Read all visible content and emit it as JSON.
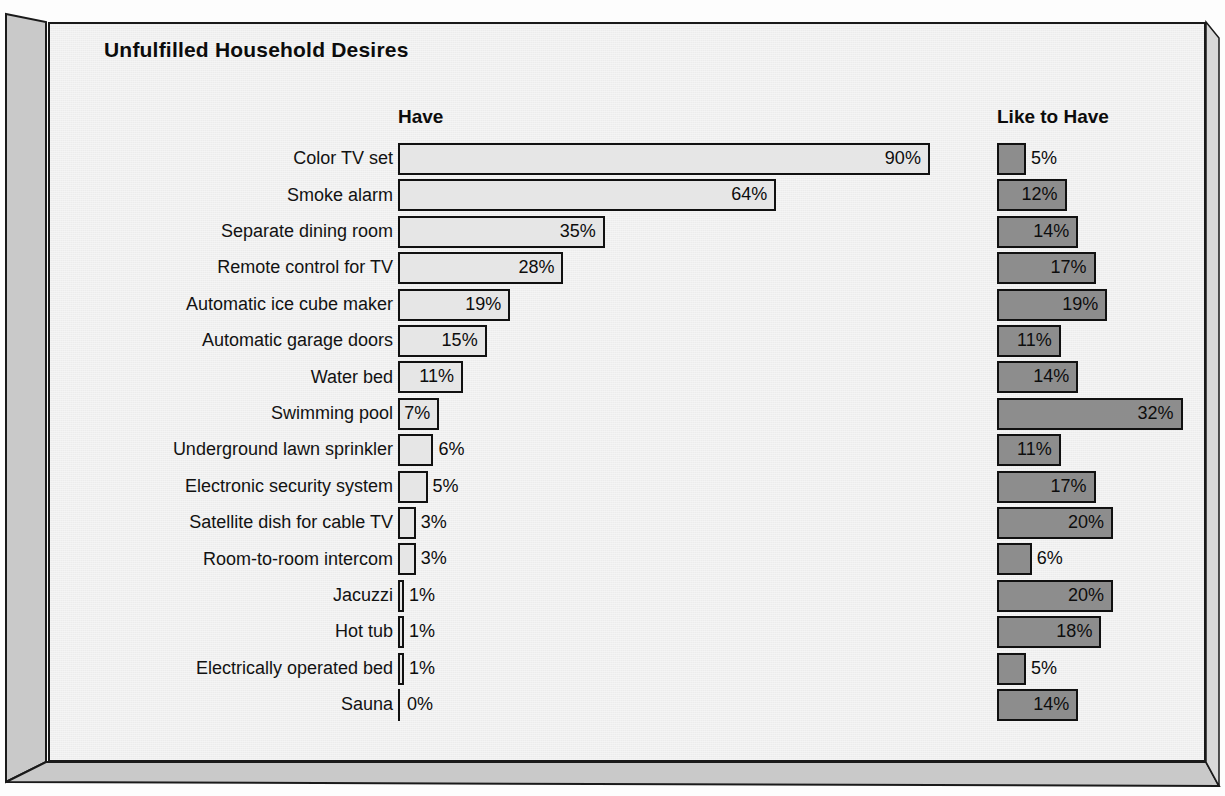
{
  "title": "Unfulfilled Household Desires",
  "headers": {
    "left": "Have",
    "right": "Like to Have"
  },
  "colors": {
    "panel_bg": "#ececec",
    "have_bar": "#e6e6e6",
    "like_bar": "#8d8d8d",
    "outline": "#111111",
    "slab": "#c6c6c6",
    "text": "#0d0d0d"
  },
  "chart_data": {
    "type": "bar",
    "title": "Unfulfilled Household Desires",
    "orientation": "horizontal",
    "xlabel": "",
    "ylabel": "",
    "grid": false,
    "legend_position": "top (column headers)",
    "categories": [
      "Color TV set",
      "Smoke alarm",
      "Separate dining room",
      "Remote control for TV",
      "Automatic ice cube maker",
      "Automatic garage doors",
      "Water bed",
      "Swimming pool",
      "Underground lawn sprinkler",
      "Electronic security system",
      "Satellite dish for cable TV",
      "Room-to-room intercom",
      "Jacuzzi",
      "Hot tub",
      "Electrically operated bed",
      "Sauna"
    ],
    "series": [
      {
        "name": "Have",
        "unit": "%",
        "values": [
          90,
          64,
          35,
          28,
          19,
          15,
          11,
          7,
          6,
          5,
          3,
          3,
          1,
          1,
          1,
          0
        ],
        "labels": [
          "90%",
          "64%",
          "35%",
          "28%",
          "19%",
          "15%",
          "11%",
          "7%",
          "6%",
          "5%",
          "3%",
          "3%",
          "1%",
          "1%",
          "1%",
          "0%"
        ],
        "label_inside": [
          true,
          true,
          true,
          true,
          true,
          true,
          true,
          true,
          false,
          false,
          false,
          false,
          false,
          false,
          false,
          false
        ]
      },
      {
        "name": "Like to Have",
        "unit": "%",
        "values": [
          5,
          12,
          14,
          17,
          19,
          11,
          14,
          32,
          11,
          17,
          20,
          6,
          20,
          18,
          5,
          14
        ],
        "labels": [
          "5%",
          "12%",
          "14%",
          "17%",
          "19%",
          "11%",
          "14%",
          "32%",
          "11%",
          "17%",
          "20%",
          "6%",
          "20%",
          "18%",
          "5%",
          "14%"
        ],
        "label_inside": [
          false,
          true,
          true,
          true,
          true,
          true,
          true,
          true,
          true,
          true,
          true,
          false,
          true,
          true,
          false,
          true
        ]
      }
    ],
    "xlim": [
      0,
      90
    ]
  }
}
